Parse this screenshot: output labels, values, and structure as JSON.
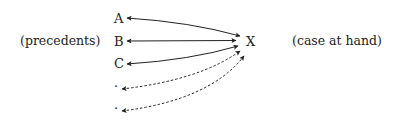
{
  "diagram": {
    "left_label": "(precedents)",
    "right_label": "(case at hand)",
    "target": "X",
    "precedents": [
      {
        "label": "A",
        "style": "solid"
      },
      {
        "label": "B",
        "style": "solid"
      },
      {
        "label": "C",
        "style": "solid"
      },
      {
        "label": "·",
        "style": "dashed"
      },
      {
        "label": "·",
        "style": "dashed"
      }
    ],
    "arrow_color": "#222222"
  }
}
